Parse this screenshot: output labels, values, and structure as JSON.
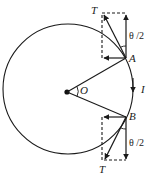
{
  "diagram": {
    "labels": {
      "top_tension": "T",
      "bottom_tension": "T",
      "point_a": "A",
      "point_b": "B",
      "center": "O",
      "current": "I",
      "top_angle": "θ /2",
      "bottom_angle": "θ /2"
    },
    "colors": {
      "stroke": "#1a1a1a",
      "background": "#ffffff"
    }
  }
}
